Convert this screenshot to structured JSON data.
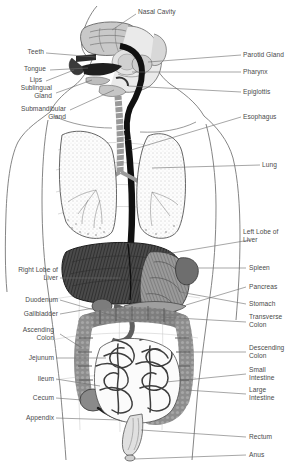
{
  "figure": {
    "background_color": "#ffffff",
    "label_color": "#4a4a4a",
    "leader_line_color": "#6b6b6b",
    "width": 304,
    "height": 467
  },
  "labels": {
    "nasal_cavity": "Nasal Cavity",
    "teeth": "Teeth",
    "tongue": "Tongue",
    "lips": "Lips",
    "sublingual_gland": "Sublingual\nGland",
    "submandibular_gland": "Submandibular\nGland",
    "parotid_gland": "Parotid Gland",
    "pharynx": "Pharynx",
    "epiglottis": "Epiglottis",
    "esophagus": "Esophagus",
    "lung": "Lung",
    "left_lobe_of_liver": "Left Lobe of\nLiver",
    "right_lobe_of_liver": "Right Lobe of\nLiver",
    "spleen": "Spleen",
    "pancreas": "Pancreas",
    "stomach": "Stomach",
    "duodenum": "Duodenum",
    "gallbladder": "Gallbladder",
    "ascending_colon": "Ascending\nColon",
    "transverse_colon": "Transverse\nColon",
    "descending_colon": "Descending\nColon",
    "jejunum": "Jejunum",
    "ileum": "Ileum",
    "cecum": "Cecum",
    "appendix": "Appendix",
    "small_intestine": "Small\nIntestine",
    "large_intestine": "Large\nIntestine",
    "rectum": "Rectum",
    "anus": "Anus"
  },
  "organ_regions": [
    {
      "name": "nasal-cavity",
      "side": "center"
    },
    {
      "name": "teeth",
      "side": "left"
    },
    {
      "name": "tongue",
      "side": "left"
    },
    {
      "name": "lips",
      "side": "left"
    },
    {
      "name": "sublingual-gland",
      "side": "left"
    },
    {
      "name": "submandibular-gland",
      "side": "left"
    },
    {
      "name": "parotid-gland",
      "side": "right"
    },
    {
      "name": "pharynx",
      "side": "right"
    },
    {
      "name": "epiglottis",
      "side": "right"
    },
    {
      "name": "esophagus",
      "side": "right"
    },
    {
      "name": "lung",
      "side": "right"
    },
    {
      "name": "left-lobe-of-liver",
      "side": "right"
    },
    {
      "name": "right-lobe-of-liver",
      "side": "left"
    },
    {
      "name": "spleen",
      "side": "right"
    },
    {
      "name": "pancreas",
      "side": "right"
    },
    {
      "name": "stomach",
      "side": "right"
    },
    {
      "name": "duodenum",
      "side": "left"
    },
    {
      "name": "gallbladder",
      "side": "left"
    },
    {
      "name": "ascending-colon",
      "side": "left"
    },
    {
      "name": "transverse-colon",
      "side": "right"
    },
    {
      "name": "descending-colon",
      "side": "right"
    },
    {
      "name": "jejunum",
      "side": "left"
    },
    {
      "name": "ileum",
      "side": "left"
    },
    {
      "name": "cecum",
      "side": "left"
    },
    {
      "name": "appendix",
      "side": "left"
    },
    {
      "name": "small-intestine",
      "side": "right"
    },
    {
      "name": "large-intestine",
      "side": "right"
    },
    {
      "name": "rectum",
      "side": "right"
    },
    {
      "name": "anus",
      "side": "right"
    }
  ]
}
